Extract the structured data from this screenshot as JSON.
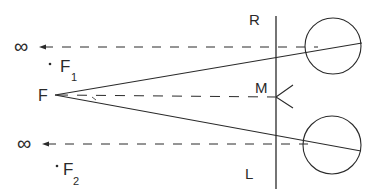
{
  "diagram": {
    "labels": {
      "infinity_top": "∞",
      "infinity_bottom": "∞",
      "F": "F",
      "F1_main": "F",
      "F1_sub": "1",
      "F2_main": "F",
      "F2_sub": "2",
      "R": "R",
      "M": "M",
      "L": "L"
    },
    "colors": {
      "stroke": "#2a2a2a",
      "background": "#ffffff"
    }
  }
}
